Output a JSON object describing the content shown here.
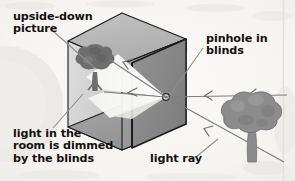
{
  "figure": {
    "type": "diagram",
    "background_color": "#f7f6f4",
    "ink_color": "#13110f"
  },
  "labels": {
    "upside_down_picture": "upside-down\npicture",
    "pinhole_in_blinds": "pinhole in\nblinds",
    "light_dimmed": "light in the\nroom is dimmed\nby the blinds",
    "light_ray": "light ray"
  },
  "scene": {
    "box": {
      "name": "darkened room shown as an open box",
      "faces": {
        "top_outer": "#b6b6b6",
        "top_inner": "#cfcfcf",
        "left_wall": "#d5d5d5",
        "floor": "#9c9c9c",
        "back_wall_left": "#8e8e8e",
        "right_wall": "#8a8a8a",
        "outline": "#1a1a1a"
      }
    },
    "pinhole": {
      "name": "pinhole in blinds",
      "shape": "small circle",
      "color": "#4a4a4a"
    },
    "light_cone": {
      "name": "cone of light spreading from pinhole",
      "color": "#fdfdfb"
    },
    "projected_image": {
      "name": "upside-down picture of the tree on the wall",
      "color": "#6e6e6e",
      "orientation": "inverted"
    },
    "tree": {
      "name": "tree outside the window",
      "canopy_color": "#8c8c8c",
      "trunk_color": "#8c8c8c"
    },
    "rays": {
      "name": "light rays travelling from tree to pinhole",
      "color": "#7d7d7d",
      "arrow_direction": "toward the pinhole",
      "count": 3
    },
    "leader_lines": {
      "color": "#8d8d8d"
    },
    "watermark_circle": {
      "name": "faint decorative circle",
      "color": "#ebe9e7"
    }
  }
}
